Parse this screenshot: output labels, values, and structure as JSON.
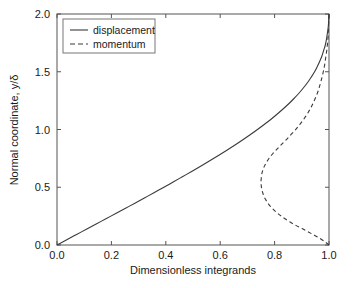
{
  "chart_data": {
    "type": "line",
    "title": "",
    "xlabel": "Dimensionless integrands",
    "ylabel": "Normal coordinate, y/δ",
    "xlim": [
      0.0,
      1.0
    ],
    "ylim": [
      0.0,
      2.0
    ],
    "xticks": [
      "0.0",
      "0.2",
      "0.4",
      "0.6",
      "0.8",
      "1.0"
    ],
    "yticks": [
      "0.0",
      "0.5",
      "1.0",
      "1.5",
      "2.0"
    ],
    "grid": false,
    "legend_position": "upper-left-inside",
    "series": [
      {
        "name": "displacement",
        "style": "solid",
        "color": "#3a3a3a",
        "x": [
          0.0,
          0.036,
          0.072,
          0.108,
          0.144,
          0.18,
          0.216,
          0.252,
          0.288,
          0.323,
          0.358,
          0.393,
          0.427,
          0.461,
          0.495,
          0.528,
          0.56,
          0.592,
          0.623,
          0.653,
          0.682,
          0.71,
          0.737,
          0.763,
          0.788,
          0.811,
          0.833,
          0.854,
          0.873,
          0.891,
          0.907,
          0.922,
          0.935,
          0.947,
          0.957,
          0.966,
          0.974,
          0.98,
          0.986,
          0.99,
          0.993,
          0.996,
          0.998,
          0.999,
          1.0
        ],
        "y": [
          0.0,
          0.0455,
          0.0909,
          0.1364,
          0.1818,
          0.2273,
          0.2727,
          0.3182,
          0.3636,
          0.4091,
          0.4545,
          0.5,
          0.5455,
          0.5909,
          0.6364,
          0.6818,
          0.7273,
          0.7727,
          0.8182,
          0.8636,
          0.9091,
          0.9545,
          1.0,
          1.0455,
          1.0909,
          1.1364,
          1.1818,
          1.2273,
          1.2727,
          1.3182,
          1.3636,
          1.4091,
          1.4545,
          1.5,
          1.5455,
          1.5909,
          1.6364,
          1.6818,
          1.7273,
          1.7727,
          1.8182,
          1.8636,
          1.9091,
          1.9545,
          2.0
        ]
      },
      {
        "name": "momentum",
        "style": "dashed",
        "color": "#3a3a3a",
        "x": [
          1.0,
          0.985,
          0.967,
          0.946,
          0.924,
          0.901,
          0.878,
          0.857,
          0.838,
          0.821,
          0.806,
          0.793,
          0.782,
          0.773,
          0.766,
          0.76,
          0.756,
          0.753,
          0.751,
          0.75,
          0.751,
          0.753,
          0.757,
          0.763,
          0.771,
          0.781,
          0.793,
          0.807,
          0.823,
          0.84,
          0.858,
          0.876,
          0.893,
          0.909,
          0.924,
          0.937,
          0.948,
          0.958,
          0.966,
          0.973,
          0.979,
          0.984,
          0.988,
          0.992,
          0.995,
          0.997,
          0.998,
          0.999,
          1.0
        ],
        "y": [
          0.0,
          0.028,
          0.056,
          0.085,
          0.113,
          0.142,
          0.17,
          0.199,
          0.227,
          0.256,
          0.284,
          0.313,
          0.341,
          0.37,
          0.398,
          0.427,
          0.455,
          0.484,
          0.512,
          0.545,
          0.58,
          0.615,
          0.65,
          0.685,
          0.72,
          0.755,
          0.79,
          0.825,
          0.865,
          0.905,
          0.95,
          0.995,
          1.045,
          1.095,
          1.15,
          1.205,
          1.262,
          1.32,
          1.38,
          1.44,
          1.5,
          1.56,
          1.625,
          1.69,
          1.755,
          1.82,
          1.885,
          1.945,
          2.0
        ]
      }
    ],
    "legend": [
      {
        "label": "displacement",
        "style": "solid"
      },
      {
        "label": "momentum",
        "style": "dashed"
      }
    ]
  }
}
